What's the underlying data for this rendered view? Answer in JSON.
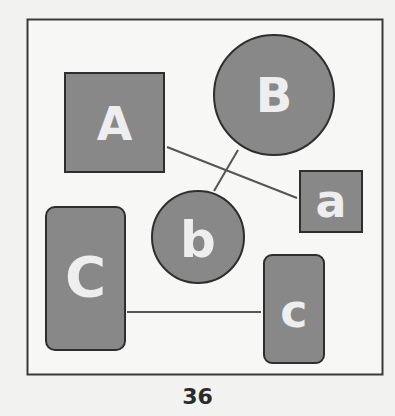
{
  "page": {
    "number": "36"
  },
  "colors": {
    "fill": "#888888",
    "stroke": "#2e2e2e",
    "label": "#eeeeee",
    "background": "#f2f2f0",
    "line": "#555555"
  },
  "shapes": [
    {
      "id": "A",
      "label": "A",
      "type": "square"
    },
    {
      "id": "B",
      "label": "B",
      "type": "circle"
    },
    {
      "id": "a",
      "label": "a",
      "type": "square"
    },
    {
      "id": "b",
      "label": "b",
      "type": "circle"
    },
    {
      "id": "C",
      "label": "C",
      "type": "rounded-rectangle"
    },
    {
      "id": "c",
      "label": "c",
      "type": "rounded-rectangle"
    }
  ],
  "connections": [
    {
      "from": "A",
      "to": "a"
    },
    {
      "from": "B",
      "to": "b"
    },
    {
      "from": "C",
      "to": "c"
    }
  ]
}
